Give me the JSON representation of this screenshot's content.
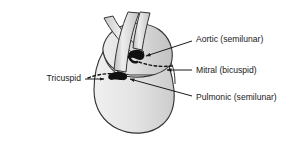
{
  "figure": {
    "background_color": "#ffffff",
    "line_color": "#1a1a1a"
  },
  "heart": {
    "name": "heart-silhouette",
    "fill_light": "#e8e8e8",
    "fill_mid": "#d2d2d2",
    "fill_dark": "#bdbdbd",
    "outline_color": "#333333"
  },
  "vessels": [
    {
      "name": "aorta-vessel",
      "fill": "#d8d8d8",
      "outline": "#333333"
    },
    {
      "name": "pulmonary-artery-vessel",
      "fill": "#cccccc",
      "outline": "#333333"
    }
  ],
  "valves": [
    {
      "id": "aortic",
      "name": "aortic-valve-marker",
      "color": "#111111"
    },
    {
      "id": "pulmonic",
      "name": "pulmonic-valve-marker",
      "color": "#111111"
    }
  ],
  "labels": [
    {
      "id": "aortic",
      "text": "Aortic (semilunar)",
      "anchor": "start",
      "x": 196,
      "y": 40
    },
    {
      "id": "mitral",
      "text": "Mitral (bicuspid)",
      "anchor": "start",
      "x": 196,
      "y": 71
    },
    {
      "id": "pulmonic",
      "text": "Pulmonic (semilunar)",
      "anchor": "start",
      "x": 196,
      "y": 98
    },
    {
      "id": "tricuspid",
      "text": "Tricuspid",
      "anchor": "end",
      "x": 81,
      "y": 79
    }
  ],
  "leaders": [
    {
      "id": "aortic-leader",
      "name": "aortic-leader-line"
    },
    {
      "id": "mitral-leader",
      "name": "mitral-leader-line"
    },
    {
      "id": "pulmonic-leader",
      "name": "pulmonic-leader-line"
    },
    {
      "id": "tricuspid-leader",
      "name": "tricuspid-leader-line"
    }
  ],
  "annulus": {
    "name": "valve-plane-dashed-line",
    "style": "dashed",
    "color": "#111111"
  }
}
